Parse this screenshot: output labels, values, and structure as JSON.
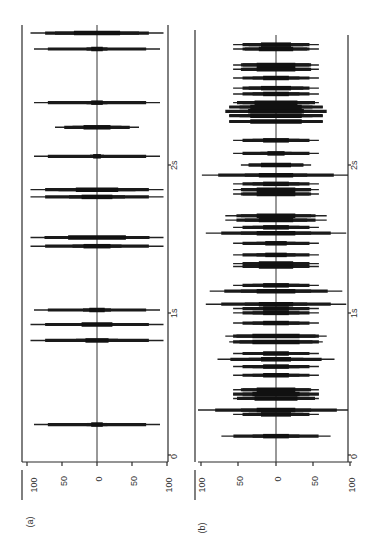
{
  "chart_data": [
    {
      "panel": "(a)",
      "type": "line",
      "orientation": "rotated-90-ccw",
      "xlabel": "time",
      "x_ticks": [
        "0",
        "1s",
        "2s"
      ],
      "y_ticks": [
        "100",
        "50",
        "0",
        "50",
        "100"
      ],
      "ylim": [
        -100,
        100
      ],
      "xlim_s": [
        0,
        2.95
      ],
      "spikes": [
        {
          "t": 0.21,
          "amp": 90,
          "core": 15
        },
        {
          "t": 0.79,
          "amp": 95,
          "core": 30
        },
        {
          "t": 0.9,
          "amp": 95,
          "core": 40
        },
        {
          "t": 1.0,
          "amp": 90,
          "core": 20
        },
        {
          "t": 1.44,
          "amp": 95,
          "core": 35
        },
        {
          "t": 1.5,
          "amp": 95,
          "core": 75
        },
        {
          "t": 1.78,
          "amp": 95,
          "core": 40
        },
        {
          "t": 1.83,
          "amp": 95,
          "core": 55
        },
        {
          "t": 2.06,
          "amp": 90,
          "core": 10
        },
        {
          "t": 2.26,
          "amp": 60,
          "core": 35
        },
        {
          "t": 2.43,
          "amp": 90,
          "core": 15
        },
        {
          "t": 2.8,
          "amp": 90,
          "core": 15
        },
        {
          "t": 2.91,
          "amp": 95,
          "core": 60
        }
      ]
    },
    {
      "panel": "(b)",
      "type": "line",
      "orientation": "rotated-90-ccw",
      "xlabel": "time",
      "x_ticks": [
        "0",
        "1s",
        "2s"
      ],
      "y_ticks": [
        "100",
        "50",
        "0",
        "50",
        "100"
      ],
      "ylim": [
        -100,
        100
      ],
      "xlim_s": [
        0,
        2.95
      ],
      "spikes": [
        {
          "t": 0.13,
          "amp": 70,
          "core": 30
        },
        {
          "t": 0.28,
          "amp": 55,
          "core": 35
        },
        {
          "t": 0.31,
          "amp": 100,
          "core": 45
        },
        {
          "t": 0.39,
          "amp": 55,
          "core": 50
        },
        {
          "t": 0.42,
          "amp": 55,
          "core": 55
        },
        {
          "t": 0.45,
          "amp": 55,
          "core": 45
        },
        {
          "t": 0.55,
          "amp": 55,
          "core": 30
        },
        {
          "t": 0.61,
          "amp": 55,
          "core": 30
        },
        {
          "t": 0.66,
          "amp": 75,
          "core": 35
        },
        {
          "t": 0.7,
          "amp": 55,
          "core": 30
        },
        {
          "t": 0.78,
          "amp": 60,
          "core": 55
        },
        {
          "t": 0.82,
          "amp": 65,
          "core": 55
        },
        {
          "t": 0.91,
          "amp": 55,
          "core": 30
        },
        {
          "t": 0.98,
          "amp": 55,
          "core": 30
        },
        {
          "t": 1.01,
          "amp": 55,
          "core": 30
        },
        {
          "t": 1.04,
          "amp": 90,
          "core": 40
        },
        {
          "t": 1.13,
          "amp": 85,
          "core": 45
        },
        {
          "t": 1.17,
          "amp": 55,
          "core": 30
        },
        {
          "t": 1.3,
          "amp": 55,
          "core": 40
        },
        {
          "t": 1.32,
          "amp": 55,
          "core": 40
        },
        {
          "t": 1.38,
          "amp": 55,
          "core": 25
        },
        {
          "t": 1.46,
          "amp": 55,
          "core": 25
        },
        {
          "t": 1.53,
          "amp": 90,
          "core": 45
        },
        {
          "t": 1.57,
          "amp": 55,
          "core": 30
        },
        {
          "t": 1.62,
          "amp": 65,
          "core": 40
        },
        {
          "t": 1.65,
          "amp": 65,
          "core": 45
        },
        {
          "t": 1.8,
          "amp": 55,
          "core": 45
        },
        {
          "t": 1.83,
          "amp": 55,
          "core": 45
        },
        {
          "t": 1.87,
          "amp": 55,
          "core": 30
        },
        {
          "t": 1.93,
          "amp": 95,
          "core": 40
        },
        {
          "t": 2.0,
          "amp": 45,
          "core": 35
        },
        {
          "t": 2.08,
          "amp": 55,
          "core": 20
        },
        {
          "t": 2.17,
          "amp": 55,
          "core": 30
        },
        {
          "t": 2.3,
          "amp": 60,
          "core": 60
        },
        {
          "t": 2.34,
          "amp": 60,
          "core": 60
        },
        {
          "t": 2.37,
          "amp": 60,
          "core": 65
        },
        {
          "t": 2.4,
          "amp": 60,
          "core": 60
        },
        {
          "t": 2.43,
          "amp": 55,
          "core": 50
        },
        {
          "t": 2.49,
          "amp": 55,
          "core": 30
        },
        {
          "t": 2.53,
          "amp": 55,
          "core": 35
        },
        {
          "t": 2.6,
          "amp": 55,
          "core": 30
        },
        {
          "t": 2.66,
          "amp": 55,
          "core": 45
        },
        {
          "t": 2.69,
          "amp": 55,
          "core": 45
        },
        {
          "t": 2.8,
          "amp": 55,
          "core": 40
        },
        {
          "t": 2.83,
          "amp": 55,
          "core": 35
        }
      ]
    }
  ],
  "labels": {
    "panel_a": "(a)",
    "panel_b": "(b)",
    "t0": "0",
    "t1": "1s",
    "t2": "2s",
    "y100": "100",
    "y50": "50",
    "y0": "0"
  }
}
